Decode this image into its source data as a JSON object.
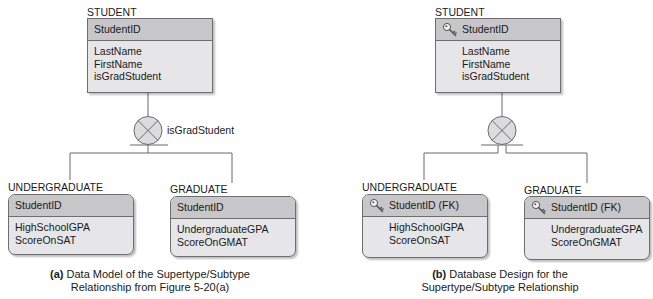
{
  "colors": {
    "header_fill": "#c7c7c9",
    "body_fill": "#e6e6e8",
    "border": "#6e6e6e",
    "line": "#6a6a6a",
    "text": "#1a1a1a"
  },
  "left": {
    "supertype": {
      "title": "STUDENT",
      "key": "StudentID",
      "attributes": [
        "LastName",
        "FirstName",
        "isGradStudent"
      ]
    },
    "category": {
      "icon": "complete-category-x-circle-icon",
      "discriminator": "isGradStudent"
    },
    "subtypes": [
      {
        "title": "UNDERGRADUATE",
        "key": "StudentID",
        "attributes": [
          "HighSchoolGPA",
          "ScoreOnSAT"
        ]
      },
      {
        "title": "GRADUATE",
        "key": "StudentID",
        "attributes": [
          "UndergraduateGPA",
          "ScoreOnGMAT"
        ]
      }
    ],
    "caption": {
      "label": "(a)",
      "line1": " Data Model of the Supertype/Subtype",
      "line2": "Relationship from Figure 5-20(a)"
    }
  },
  "right": {
    "supertype": {
      "title": "STUDENT",
      "key": "StudentID",
      "key_icon": "key-icon",
      "attributes": [
        "LastName",
        "FirstName",
        "isGradStudent"
      ]
    },
    "category": {
      "icon": "complete-category-x-circle-icon"
    },
    "subtypes": [
      {
        "title": "UNDERGRADUATE",
        "key": "StudentID (FK)",
        "key_icon": "key-icon",
        "attributes": [
          "HighSchoolGPA",
          "ScoreOnSAT"
        ]
      },
      {
        "title": "GRADUATE",
        "key": "StudentID (FK)",
        "key_icon": "key-icon",
        "attributes": [
          "UndergraduateGPA",
          "ScoreOnGMAT"
        ]
      }
    ],
    "caption": {
      "label": "(b)",
      "line1": " Database Design for the",
      "line2": "Supertype/Subtype Relationship"
    }
  }
}
